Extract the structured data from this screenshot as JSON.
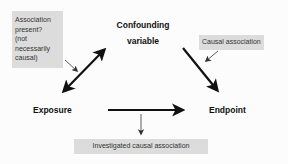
{
  "diagram": {
    "title": "",
    "nodes": {
      "confounder": {
        "line1": "Confounding",
        "line2": "variable"
      },
      "exposure": "Exposure",
      "endpoint": "Endpoint"
    },
    "notes": {
      "association": {
        "lines": [
          "Association",
          "present?",
          "(not",
          "necessarily",
          "causal)"
        ]
      },
      "causal": "Causal association",
      "investigated": "Investigated causal association"
    },
    "edges": [
      {
        "from": "exposure",
        "to": "confounder",
        "type": "bidirectional",
        "meaning": "Association present? (not necessarily causal)"
      },
      {
        "from": "confounder",
        "to": "endpoint",
        "type": "directed",
        "meaning": "Causal association"
      },
      {
        "from": "exposure",
        "to": "endpoint",
        "type": "directed",
        "meaning": "Investigated causal association"
      }
    ],
    "colors": {
      "background": "#fcfcfc",
      "arrow": "#111111",
      "note_fill": "#dcdcdc",
      "note_text": "#333333"
    }
  }
}
